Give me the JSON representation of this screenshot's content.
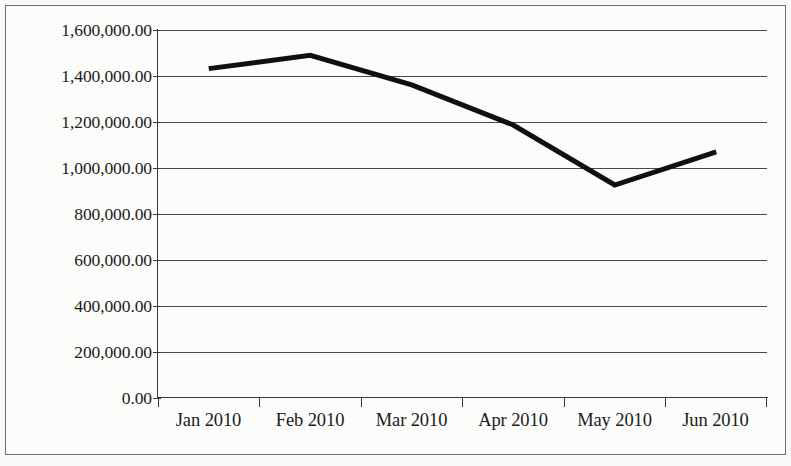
{
  "chart_data": {
    "type": "line",
    "title": "",
    "subtitle": "",
    "xlabel": "",
    "ylabel": "",
    "categories": [
      "Jan 2010",
      "Feb 2010",
      "Mar 2010",
      "Apr 2010",
      "May 2010",
      "Jun 2010"
    ],
    "series": [
      {
        "name": "",
        "values": [
          1432000,
          1490000,
          1361000,
          1187000,
          926000,
          1070000
        ]
      }
    ],
    "ylim": [
      0,
      1600000
    ],
    "ytick_values": [
      0,
      200000,
      400000,
      600000,
      800000,
      1000000,
      1200000,
      1400000,
      1600000
    ],
    "ytick_labels": [
      "0.00",
      "200,000.00",
      "400,000.00",
      "600,000.00",
      "800,000.00",
      "1,000,000.00",
      "1,200,000.00",
      "1,400,000.00",
      "1,600,000.00"
    ],
    "grid": "horizontal",
    "legend": "none",
    "line_color": "#101010",
    "line_width": 5,
    "markers": "none",
    "background_color": "#fdfdfb",
    "axis_color": "#3a3a3a",
    "annotations": []
  }
}
